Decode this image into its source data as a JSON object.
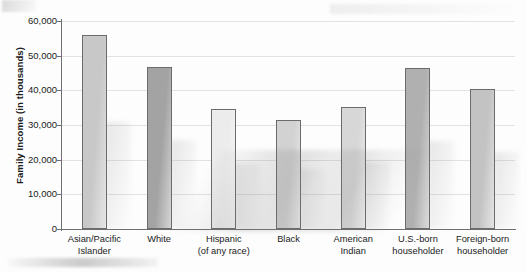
{
  "chart_data": {
    "type": "bar",
    "title": "",
    "xlabel": "",
    "ylabel": "Family Income (in thousands)",
    "ylim": [
      0,
      60000
    ],
    "ytick_values": [
      0,
      10000,
      20000,
      30000,
      40000,
      50000,
      60000
    ],
    "ytick_labels": [
      "0",
      "10,000",
      "20,000",
      "30,000",
      "40,000",
      "50,000",
      "60,000"
    ],
    "grid": true,
    "legend": "none",
    "categories": [
      "Asian/Pacific\nIslander",
      "White",
      "Hispanic\n(of any race)",
      "Black",
      "American\nIndian",
      "U.S.-born\nhouseholder",
      "Foreign-born\nhouseholder"
    ],
    "values": [
      56000,
      46700,
      34500,
      31400,
      35300,
      46400,
      40300
    ],
    "bar_colors": [
      "#c8c8c8",
      "#a3a3a3",
      "#ececec",
      "#d2d2d2",
      "#d7d7d7",
      "#b0b0b0",
      "#c3c3c3"
    ],
    "bar_edge_color": "#6b6b6b",
    "axis_color": "#6f6f6f",
    "grid_color": "#e2e2e2",
    "background": "#fdfdfd"
  }
}
